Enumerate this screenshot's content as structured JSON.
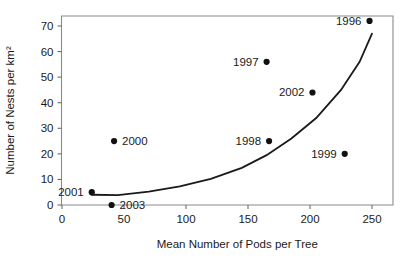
{
  "chart_data": {
    "type": "scatter",
    "title": "",
    "subtitle": "",
    "xlabel": "Mean Number of Pods per Tree",
    "ylabel": "Number of Nests per km²",
    "xlim": [
      0,
      262
    ],
    "ylim": [
      0,
      75
    ],
    "grid": false,
    "legend": "none",
    "xticks": [
      0,
      50,
      100,
      150,
      200,
      250
    ],
    "xtick_labels": [
      "0",
      "50",
      "100",
      "150",
      "200",
      "250"
    ],
    "yticks": [
      0,
      10,
      20,
      30,
      40,
      50,
      60,
      70
    ],
    "ytick_labels": [
      "0",
      "10",
      "20",
      "30",
      "40",
      "50",
      "60",
      "70"
    ],
    "point_label_field": "year",
    "points": [
      {
        "year": "2001",
        "x": 24,
        "y": 5,
        "label_side": "left"
      },
      {
        "year": "2003",
        "x": 40,
        "y": 0,
        "label_side": "right"
      },
      {
        "year": "2000",
        "x": 42,
        "y": 25,
        "label_side": "right"
      },
      {
        "year": "1997",
        "x": 165,
        "y": 56,
        "label_side": "left"
      },
      {
        "year": "1998",
        "x": 167,
        "y": 25,
        "label_side": "left"
      },
      {
        "year": "2002",
        "x": 202,
        "y": 44,
        "label_side": "left"
      },
      {
        "year": "1999",
        "x": 228,
        "y": 20,
        "label_side": "left"
      },
      {
        "year": "1996",
        "x": 248,
        "y": 72,
        "label_side": "left"
      }
    ],
    "fit_curve": {
      "kind": "exponential",
      "description": "exponential trend line through the scatter",
      "x_start": 24,
      "x_end": 250,
      "y_start": 4.0,
      "y_end": 67.0,
      "samples": [
        {
          "x": 24,
          "y": 4.0
        },
        {
          "x": 45,
          "y": 3.9
        },
        {
          "x": 70,
          "y": 5.2
        },
        {
          "x": 95,
          "y": 7.3
        },
        {
          "x": 120,
          "y": 10.2
        },
        {
          "x": 145,
          "y": 14.5
        },
        {
          "x": 165,
          "y": 19.5
        },
        {
          "x": 185,
          "y": 26.0
        },
        {
          "x": 205,
          "y": 34.0
        },
        {
          "x": 225,
          "y": 45.0
        },
        {
          "x": 240,
          "y": 56.0
        },
        {
          "x": 250,
          "y": 67.0
        }
      ]
    },
    "colors": {
      "point": "#111111",
      "curve": "#1a1a1a",
      "frame": "#8a8a8a",
      "text": "#1a1a1a",
      "background": "#ffffff"
    }
  }
}
